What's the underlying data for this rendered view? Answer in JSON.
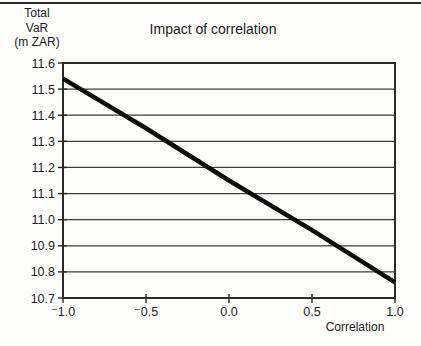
{
  "page": {
    "background": "#fdfdfc",
    "top_rule_color": "#2a2a2a"
  },
  "chart": {
    "title": "Impact of correlation",
    "y_axis_title_lines": [
      "Total",
      "VaR",
      "(m ZAR)"
    ],
    "x_axis_title": "Correlation"
  },
  "chart_data": {
    "type": "line",
    "title": "Impact of correlation",
    "xlabel": "Correlation",
    "ylabel": "Total VaR (m ZAR)",
    "x": [
      -1.0,
      -0.5,
      0.0,
      0.5,
      1.0
    ],
    "series": [
      {
        "name": "Total VaR",
        "values": [
          11.54,
          11.35,
          11.15,
          10.96,
          10.76
        ]
      }
    ],
    "xlim": [
      -1.0,
      1.0
    ],
    "ylim": [
      10.7,
      11.6
    ],
    "x_tick_values": [
      -1.0,
      -0.5,
      0.0,
      0.5,
      1.0
    ],
    "x_tick_labels": [
      "⁻1.0",
      "⁻0.5",
      "0.0",
      "0.5",
      "1.0"
    ],
    "y_tick_values": [
      11.6,
      11.5,
      11.4,
      11.3,
      11.2,
      11.1,
      11.0,
      10.9,
      10.8,
      10.7
    ],
    "y_tick_labels": [
      "11.6",
      "11.5",
      "11.4",
      "11.3",
      "11.2",
      "11.1",
      "11.0",
      "10.9",
      "10.8",
      "10.7"
    ],
    "grid": "horizontal",
    "legend": "none",
    "line_width": 4.5,
    "colors": {
      "ink": "#1c1c1c",
      "grid": "#3e3e3e",
      "border": "#2b2b2b",
      "line": "#0a0a0a",
      "rule": "#2a2a2a",
      "background": "#fdfdfc"
    }
  }
}
